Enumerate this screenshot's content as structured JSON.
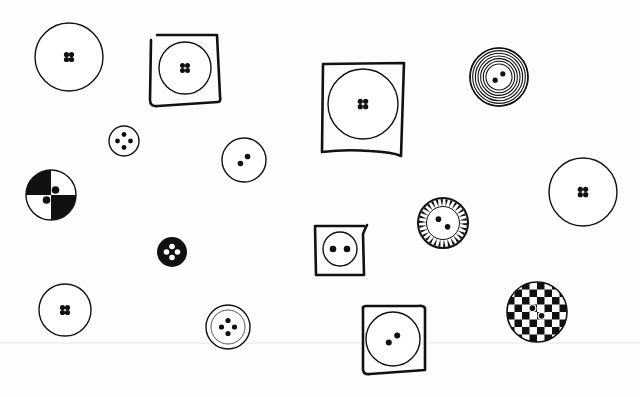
{
  "scene": {
    "width": 640,
    "height": 397,
    "background": "#fdfdfd",
    "ink": "#111111",
    "scanline_y": 342
  },
  "buttons": [
    {
      "id": "plain-large-top-left",
      "cx": 69,
      "cy": 57,
      "r": 34,
      "style": "plain",
      "holes": 4,
      "hole_r": 2.6,
      "hole_gap": 4.5
    },
    {
      "id": "framed-top-left",
      "cx": 185,
      "cy": 68,
      "r": 26,
      "style": "plain",
      "holes": 4,
      "hole_r": 2.5,
      "hole_gap": 4.5,
      "frame": {
        "x": 150,
        "y": 35,
        "w": 70,
        "h": 70,
        "path": "M151 40 L150 100 Q150 107 158 106 L218 102 Q221 102 220 96 L217 35 L157 35"
      }
    },
    {
      "id": "small-four-hole",
      "cx": 124,
      "cy": 141,
      "r": 15,
      "style": "plain",
      "holes": 4,
      "hole_r": 2.4,
      "hole_gap": 6.5,
      "diamond": true
    },
    {
      "id": "two-hole-middle",
      "cx": 244,
      "cy": 160,
      "r": 22,
      "style": "plain",
      "holes": 2,
      "hole_r": 2.8,
      "hole_gap": 5,
      "angle": -45
    },
    {
      "id": "framed-large-center",
      "cx": 363,
      "cy": 104,
      "r": 35,
      "style": "plain",
      "holes": 4,
      "hole_r": 2.6,
      "hole_gap": 4.8,
      "frame": {
        "x": 321,
        "y": 63,
        "w": 86,
        "h": 95,
        "path": "M323 64 L322 152 Q345 149 370 151 Q392 152 401 156 L404 63 Z"
      }
    },
    {
      "id": "concentric-rings",
      "cx": 499,
      "cy": 77,
      "r": 29,
      "style": "rings",
      "rings": 7,
      "holes": 2,
      "hole_r": 2.6,
      "hole_gap": 5,
      "angle": -40
    },
    {
      "id": "quartered-black-white",
      "cx": 51,
      "cy": 195,
      "r": 25,
      "style": "quarters",
      "holes": 2,
      "hole_r": 3.2,
      "hole_gap": 5.5,
      "angle": -40
    },
    {
      "id": "solid-black-small",
      "cx": 172,
      "cy": 252,
      "r": 15,
      "style": "solid",
      "holes": 3,
      "hole_r": 2.8,
      "hole_gap": 5.5
    },
    {
      "id": "framed-small-two-hole",
      "cx": 340,
      "cy": 249,
      "r": 17,
      "style": "plain",
      "holes": 2,
      "hole_r": 3.3,
      "hole_gap": 7,
      "angle": 0,
      "frame": {
        "x": 314,
        "y": 225,
        "w": 52,
        "h": 50,
        "path": "M315 226 L316 275 L364 275 L363 234 Q365 229 367 225 M315 226 L364 226"
      }
    },
    {
      "id": "sunburst-rim",
      "cx": 443,
      "cy": 223,
      "r": 25,
      "style": "sunburst",
      "teeth": 30,
      "holes": 2,
      "hole_r": 2.8,
      "hole_gap": 6,
      "angle": 40
    },
    {
      "id": "plain-large-right",
      "cx": 583,
      "cy": 192,
      "r": 34,
      "style": "plain",
      "holes": 4,
      "hole_r": 2.6,
      "hole_gap": 4.8
    },
    {
      "id": "plain-bottom-left",
      "cx": 65,
      "cy": 310,
      "r": 26,
      "style": "plain",
      "holes": 4,
      "hole_r": 2.6,
      "hole_gap": 4.5
    },
    {
      "id": "double-rim-four-hole",
      "cx": 228,
      "cy": 327,
      "r": 22,
      "style": "double",
      "inner_r": 17,
      "holes": 4,
      "hole_r": 2.6,
      "hole_gap": 6.5,
      "diamond": true
    },
    {
      "id": "framed-bottom-center",
      "cx": 393,
      "cy": 339,
      "r": 27,
      "style": "plain",
      "holes": 2,
      "hole_r": 3,
      "hole_gap": 5.5,
      "angle": -40,
      "frame": {
        "x": 359,
        "y": 305,
        "w": 68,
        "h": 70,
        "path": "M363 307 L363 370 Q364 375 370 374 L425 370 L425 308 Q423 305 418 306 L366 306 Q362 306 363 310"
      }
    },
    {
      "id": "checkerboard",
      "cx": 537,
      "cy": 312,
      "r": 30,
      "style": "checker",
      "cells": 8,
      "holes": 2,
      "hole_r": 2.8,
      "hole_gap": 6,
      "angle": 40
    }
  ]
}
